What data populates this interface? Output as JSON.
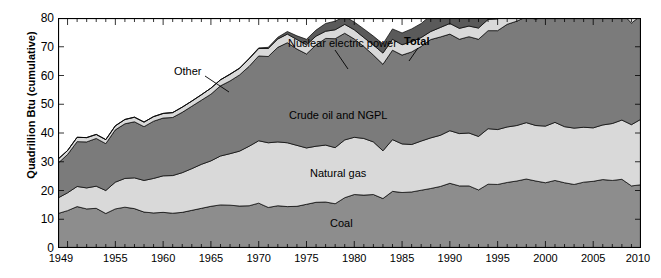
{
  "chart_data": {
    "type": "area",
    "stacked": true,
    "title": "",
    "xlabel": "",
    "ylabel": "Quadrillion Btu (cumulative)",
    "xlim": [
      1949,
      2010
    ],
    "ylim": [
      0,
      80
    ],
    "ytick_labels": [
      "0",
      "10",
      "20",
      "30",
      "40",
      "50",
      "60",
      "70",
      "80"
    ],
    "ytick_values": [
      0,
      10,
      20,
      30,
      40,
      50,
      60,
      70,
      80
    ],
    "xtick_labels": [
      "1949",
      "1955",
      "1960",
      "1965",
      "1970",
      "1975",
      "1980",
      "1985",
      "1990",
      "1995",
      "2000",
      "2005",
      "2010"
    ],
    "xtick_values": [
      1949,
      1955,
      1960,
      1965,
      1970,
      1975,
      1980,
      1985,
      1990,
      1995,
      2000,
      2005,
      2010
    ],
    "grid": false,
    "minor_ticks": "every year on top and bottom axes",
    "legend": "inline labels on bands",
    "annotations": [
      {
        "text": "Other",
        "leader": true
      },
      {
        "text": "Nuclear electric power",
        "leader": true
      },
      {
        "text": "Total",
        "leader": true,
        "bold": true
      },
      {
        "text": "Crude oil and NGPL",
        "leader": false
      },
      {
        "text": "Natural gas",
        "leader": false
      },
      {
        "text": "Coal",
        "leader": false
      }
    ],
    "x": [
      1949,
      1950,
      1951,
      1952,
      1953,
      1954,
      1955,
      1956,
      1957,
      1958,
      1959,
      1960,
      1961,
      1962,
      1963,
      1964,
      1965,
      1966,
      1967,
      1968,
      1969,
      1970,
      1971,
      1972,
      1973,
      1974,
      1975,
      1976,
      1977,
      1978,
      1979,
      1980,
      1981,
      1982,
      1983,
      1984,
      1985,
      1986,
      1987,
      1988,
      1989,
      1990,
      1991,
      1992,
      1993,
      1994,
      1995,
      1996,
      1997,
      1998,
      1999,
      2000,
      2001,
      2002,
      2003,
      2004,
      2005,
      2006,
      2007,
      2008,
      2009,
      2010
    ],
    "series": [
      {
        "name": "Coal",
        "color": "#8d8d8d",
        "values": [
          12.0,
          13.0,
          14.4,
          13.6,
          13.8,
          12.0,
          13.6,
          14.2,
          13.7,
          12.5,
          12.2,
          12.4,
          12.1,
          12.4,
          13.1,
          13.8,
          14.5,
          15.0,
          14.9,
          14.6,
          14.7,
          15.6,
          14.1,
          14.7,
          14.4,
          14.5,
          15.2,
          15.9,
          16.0,
          15.4,
          17.5,
          18.6,
          18.4,
          18.6,
          17.2,
          19.7,
          19.3,
          19.5,
          20.1,
          20.7,
          21.4,
          22.5,
          21.6,
          21.6,
          20.2,
          22.2,
          22.1,
          22.8,
          23.3,
          24.0,
          23.3,
          22.7,
          23.5,
          22.7,
          22.1,
          22.9,
          23.2,
          23.8,
          23.5,
          23.9,
          21.6,
          22.0
        ]
      },
      {
        "name": "Natural gas",
        "color": "#d9d9d9",
        "values": [
          5.4,
          6.2,
          7.0,
          7.3,
          7.7,
          8.0,
          9.3,
          10.0,
          10.7,
          11.0,
          12.0,
          12.7,
          13.1,
          13.8,
          14.5,
          15.3,
          15.8,
          17.0,
          17.9,
          19.1,
          20.7,
          21.7,
          22.5,
          22.2,
          22.2,
          21.2,
          19.6,
          19.5,
          19.8,
          19.5,
          20.1,
          19.9,
          19.7,
          18.3,
          16.6,
          18.0,
          16.9,
          16.5,
          17.1,
          17.6,
          17.8,
          18.3,
          18.2,
          18.4,
          18.6,
          19.3,
          19.1,
          19.3,
          19.3,
          19.6,
          19.3,
          19.7,
          20.2,
          19.5,
          19.6,
          19.1,
          18.6,
          19.0,
          19.8,
          20.6,
          21.3,
          22.8
        ]
      },
      {
        "name": "Crude oil and NGPL",
        "color": "#7b7b7b",
        "values": [
          12.1,
          13.3,
          15.6,
          16.0,
          16.6,
          16.3,
          18.2,
          19.0,
          19.5,
          18.7,
          19.9,
          20.1,
          20.2,
          21.0,
          21.7,
          22.3,
          23.2,
          24.4,
          25.3,
          26.5,
          27.8,
          29.5,
          30.0,
          32.9,
          34.8,
          33.5,
          32.7,
          35.2,
          37.1,
          37.9,
          37.1,
          34.2,
          32.0,
          30.2,
          30.1,
          31.1,
          30.9,
          32.2,
          32.9,
          34.2,
          34.2,
          33.6,
          32.8,
          33.5,
          33.8,
          34.1,
          34.4,
          35.7,
          36.3,
          36.8,
          37.0,
          38.3,
          38.3,
          38.2,
          38.8,
          40.3,
          40.4,
          40.0,
          39.8,
          37.3,
          35.3,
          36.1
        ]
      },
      {
        "name": "Other",
        "color": "#d9d9d9",
        "values": [
          1.4,
          1.4,
          1.5,
          1.5,
          1.4,
          1.4,
          1.4,
          1.5,
          1.6,
          1.6,
          1.6,
          1.6,
          1.7,
          1.8,
          1.8,
          1.9,
          2.1,
          2.1,
          2.3,
          2.3,
          2.6,
          2.6,
          2.8,
          2.9,
          3.0,
          3.3,
          3.2,
          3.1,
          2.5,
          3.1,
          3.1,
          3.2,
          3.1,
          3.5,
          3.9,
          3.8,
          3.6,
          3.6,
          3.1,
          2.8,
          3.3,
          3.7,
          3.8,
          3.7,
          3.9,
          3.9,
          4.1,
          4.1,
          3.8,
          3.7,
          3.8,
          3.5,
          3.0,
          3.6,
          3.5,
          3.5,
          3.8,
          4.4,
          4.5,
          5.2,
          5.6,
          5.8
        ]
      },
      {
        "name": "Nuclear electric power",
        "color": "#5a5a5a",
        "values": [
          0.0,
          0.0,
          0.0,
          0.0,
          0.0,
          0.0,
          0.0,
          0.0,
          0.0,
          0.0,
          0.0,
          0.0,
          0.0,
          0.0,
          0.0,
          0.0,
          0.0,
          0.0,
          0.1,
          0.1,
          0.2,
          0.2,
          0.4,
          0.6,
          0.9,
          1.3,
          1.9,
          2.1,
          2.7,
          3.0,
          2.8,
          2.7,
          3.0,
          3.1,
          3.2,
          3.6,
          4.1,
          4.4,
          4.9,
          5.6,
          5.7,
          6.1,
          6.4,
          6.5,
          6.5,
          6.8,
          7.1,
          7.2,
          6.7,
          7.1,
          7.6,
          7.9,
          8.0,
          8.1,
          7.9,
          8.2,
          8.2,
          8.2,
          8.5,
          8.4,
          8.4,
          8.4
        ]
      }
    ]
  },
  "labels": {
    "other": "Other",
    "nuclear": "Nuclear electric power",
    "total": "Total",
    "crude": "Crude oil and NGPL",
    "gas": "Natural gas",
    "coal": "Coal"
  }
}
